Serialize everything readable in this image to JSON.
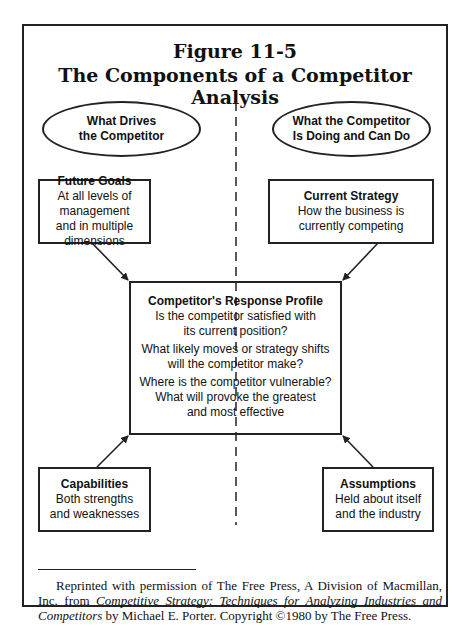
{
  "figure": {
    "number": "Figure 11-5",
    "title": "The Components of a Competitor Analysis"
  },
  "headers": {
    "left": [
      "What Drives",
      "the Competitor"
    ],
    "right": [
      "What the Competitor",
      "Is Doing and Can Do"
    ]
  },
  "boxes": {
    "future_goals": {
      "title": "Future Goals",
      "lines": [
        "At all levels of management",
        "and in multiple dimensions"
      ]
    },
    "current_strategy": {
      "title": "Current Strategy",
      "lines": [
        "How the business is",
        "currently competing"
      ]
    },
    "response_profile": {
      "title": "Competitor's Response Profile",
      "questions": [
        [
          "Is the competitor satisfied with",
          "its current position?"
        ],
        [
          "What likely moves or strategy shifts",
          "will the competitor make?"
        ],
        [
          "Where is the competitor vulnerable?",
          "What will provoke the greatest",
          "and most effective"
        ]
      ]
    },
    "capabilities": {
      "title": "Capabilities",
      "lines": [
        "Both strengths",
        "and weaknesses"
      ]
    },
    "assumptions": {
      "title": "Assumptions",
      "lines": [
        "Held about itself",
        "and the industry"
      ]
    }
  },
  "credit": {
    "part1": "Reprinted with permission of The Free Press, A Division of Macmillan, Inc. from ",
    "book_title": "Competitive Strategy: Techniques for Analyzing Industries and Competitors",
    "part2": " by Michael E. Porter. Copyright ©1980 by The Free Press."
  }
}
